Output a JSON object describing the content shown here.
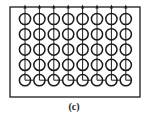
{
  "figure": {
    "caption": "(c)",
    "frame": {
      "x": 10,
      "y": 7,
      "width": 130,
      "height": 90
    },
    "grid": {
      "columns": 8,
      "rows": 5,
      "x0": 25,
      "y0": 19,
      "dx": 14.4,
      "dy": 15.3,
      "radius": 5.6
    },
    "top_arrows": true,
    "bottom_row_style": "horizontal-link",
    "stroke_color": "#1a1a1a"
  }
}
